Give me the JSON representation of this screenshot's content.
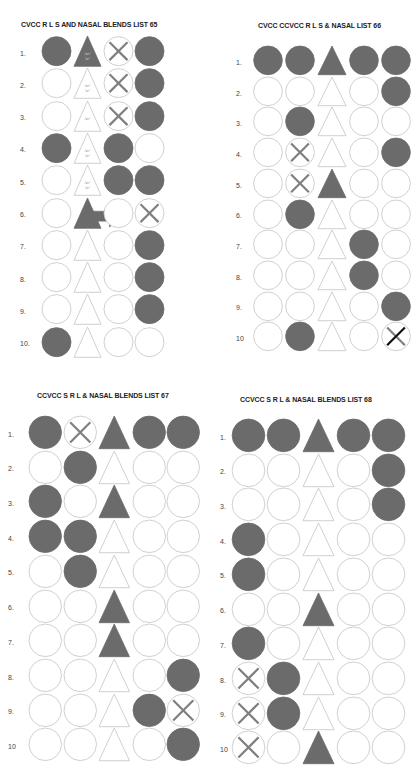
{
  "page": {
    "fill_color": "#6b6b6b",
    "stroke_color": "#c4c4c4",
    "cross_color": "#7f7f7f",
    "dark_cross_color": "#111111"
  },
  "lists": [
    {
      "id": "list65",
      "title": "CVCC R  L S AND NASAL BLENDS LIST 65",
      "columns": 4,
      "rows": [
        {
          "num": "1.",
          "cells": [
            "circle-filled",
            "triangle-filled-text",
            "circle-cross",
            "circle-filled"
          ]
        },
        {
          "num": "2.",
          "cells": [
            "circle",
            "triangle-text",
            "circle-cross",
            "circle-filled"
          ]
        },
        {
          "num": "3.",
          "cells": [
            "circle",
            "triangle-text-single",
            "circle-cross",
            "circle-filled"
          ]
        },
        {
          "num": "4.",
          "cells": [
            "circle-filled",
            "triangle-text",
            "circle-filled",
            "circle"
          ]
        },
        {
          "num": "5.",
          "cells": [
            "circle",
            "triangle-text",
            "circle-filled",
            "circle-filled"
          ]
        },
        {
          "num": "6.",
          "cells": [
            "circle",
            "triangle-filled-arrow",
            "circle",
            "circle-cross"
          ]
        },
        {
          "num": "7.",
          "cells": [
            "circle",
            "triangle",
            "circle",
            "circle-filled"
          ]
        },
        {
          "num": "8.",
          "cells": [
            "circle",
            "triangle",
            "circle",
            "circle-filled"
          ]
        },
        {
          "num": "9.",
          "cells": [
            "circle",
            "triangle",
            "circle",
            "circle-filled"
          ]
        },
        {
          "num": "10.",
          "cells": [
            "circle-filled",
            "triangle",
            "circle",
            "circle"
          ]
        }
      ],
      "triangle_labels": {
        "line1": "/er/",
        "line2": "'er'"
      }
    },
    {
      "id": "list66",
      "title": "CVCC CCVCC R L S & NASAL LIST 66",
      "columns": 5,
      "rows": [
        {
          "num": "1.",
          "cells": [
            "circle-filled",
            "circle-filled",
            "triangle-filled",
            "circle-filled",
            "circle-filled"
          ]
        },
        {
          "num": "2.",
          "cells": [
            "circle",
            "circle",
            "triangle",
            "circle",
            "circle-filled"
          ]
        },
        {
          "num": "3.",
          "cells": [
            "circle",
            "circle-filled",
            "triangle",
            "circle",
            "circle"
          ]
        },
        {
          "num": "4.",
          "cells": [
            "circle",
            "circle-cross",
            "triangle",
            "circle",
            "circle-filled"
          ]
        },
        {
          "num": "5.",
          "cells": [
            "circle",
            "circle-cross",
            "triangle-filled",
            "circle",
            "circle"
          ]
        },
        {
          "num": "6.",
          "cells": [
            "circle",
            "circle-filled",
            "triangle",
            "circle",
            "circle"
          ]
        },
        {
          "num": "7.",
          "cells": [
            "circle",
            "circle",
            "triangle",
            "circle-filled",
            "circle"
          ]
        },
        {
          "num": "8.",
          "cells": [
            "circle",
            "circle",
            "triangle",
            "circle-filled",
            "circle"
          ]
        },
        {
          "num": "9.",
          "cells": [
            "circle",
            "circle",
            "triangle",
            "circle",
            "circle-filled"
          ]
        },
        {
          "num": "10",
          "cells": [
            "circle",
            "circle-filled",
            "triangle",
            "circle",
            "circle-cross-dark"
          ]
        }
      ]
    },
    {
      "id": "list67",
      "title": "CCVCC  S R L & NASAL BLENDS LIST 67",
      "columns": 5,
      "rows": [
        {
          "num": "1.",
          "cells": [
            "circle-filled",
            "circle-cross",
            "triangle-filled",
            "circle-filled",
            "circle-filled"
          ]
        },
        {
          "num": "2.",
          "cells": [
            "circle",
            "circle-filled",
            "triangle",
            "circle",
            "circle"
          ]
        },
        {
          "num": "3.",
          "cells": [
            "circle-filled",
            "circle",
            "triangle-filled",
            "circle",
            "circle"
          ]
        },
        {
          "num": "4.",
          "cells": [
            "circle-filled",
            "circle-filled",
            "triangle",
            "circle",
            "circle"
          ]
        },
        {
          "num": "5.",
          "cells": [
            "circle",
            "circle-filled",
            "triangle",
            "circle",
            "circle"
          ]
        },
        {
          "num": "6.",
          "cells": [
            "circle",
            "circle",
            "triangle-filled",
            "circle",
            "circle"
          ]
        },
        {
          "num": "7.",
          "cells": [
            "circle",
            "circle",
            "triangle-filled",
            "circle",
            "circle"
          ]
        },
        {
          "num": "8.",
          "cells": [
            "circle",
            "circle",
            "triangle",
            "circle",
            "circle-filled"
          ]
        },
        {
          "num": "9.",
          "cells": [
            "circle",
            "circle",
            "triangle",
            "circle-filled",
            "circle-cross"
          ]
        },
        {
          "num": "10",
          "cells": [
            "circle",
            "circle",
            "triangle",
            "circle",
            "circle-filled"
          ]
        }
      ]
    },
    {
      "id": "list68",
      "title": "CCVCC S R L & NASAL BLENDS LIST 68",
      "columns": 5,
      "rows": [
        {
          "num": "1.",
          "cells": [
            "circle-filled",
            "circle-filled",
            "triangle-filled",
            "circle-filled",
            "circle-filled"
          ]
        },
        {
          "num": "2.",
          "cells": [
            "circle",
            "circle",
            "triangle",
            "circle",
            "circle-filled"
          ]
        },
        {
          "num": "3.",
          "cells": [
            "circle",
            "circle",
            "triangle",
            "circle",
            "circle-filled"
          ]
        },
        {
          "num": "4.",
          "cells": [
            "circle-filled",
            "circle",
            "triangle",
            "circle",
            "circle"
          ]
        },
        {
          "num": "5.",
          "cells": [
            "circle-filled",
            "circle",
            "triangle",
            "circle",
            "circle"
          ]
        },
        {
          "num": "6.",
          "cells": [
            "circle",
            "circle",
            "triangle-filled",
            "circle",
            "circle"
          ]
        },
        {
          "num": "7.",
          "cells": [
            "circle-filled",
            "circle",
            "triangle",
            "circle",
            "circle"
          ]
        },
        {
          "num": "8.",
          "cells": [
            "circle-cross",
            "circle-filled",
            "triangle",
            "circle",
            "circle"
          ]
        },
        {
          "num": "9.",
          "cells": [
            "circle-cross",
            "circle-filled",
            "triangle",
            "circle",
            "circle"
          ]
        },
        {
          "num": "10",
          "cells": [
            "circle-cross",
            "circle",
            "triangle-filled",
            "circle",
            "circle"
          ]
        }
      ]
    }
  ]
}
